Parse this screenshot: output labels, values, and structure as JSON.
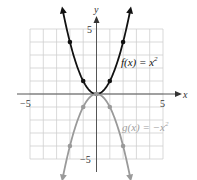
{
  "chart_data": {
    "type": "line",
    "title": "",
    "xlabel": "x",
    "ylabel": "y",
    "xlim": [
      -5,
      5
    ],
    "ylim": [
      -5,
      5
    ],
    "grid": true,
    "x_ticks_labeled": [
      "-5",
      "5"
    ],
    "y_ticks_labeled": [
      "5",
      "-5"
    ],
    "series": [
      {
        "name": "f(x) = x²",
        "label_text": "f(x) = x",
        "label_exp": "2",
        "color": "#111111",
        "points": [
          [
            -2,
            4
          ],
          [
            -1,
            1
          ],
          [
            0,
            0
          ],
          [
            1,
            1
          ],
          [
            2,
            4
          ]
        ],
        "arrows": "both-ends-up"
      },
      {
        "name": "g(x) = −x²",
        "label_text": "g(x) = −x",
        "label_exp": "2",
        "color": "#9a9a9a",
        "points": [
          [
            -2,
            -4
          ],
          [
            -1,
            -1
          ],
          [
            0,
            0
          ],
          [
            1,
            -1
          ],
          [
            2,
            -4
          ]
        ],
        "arrows": "both-ends-down"
      }
    ]
  },
  "labels": {
    "x_axis": "x",
    "y_axis": "y",
    "x_min": "−5",
    "x_max": "5",
    "y_max": "5",
    "y_min": "−5",
    "f_label": "f(x) = x",
    "f_exp": "2",
    "g_label": "g(x) = −x",
    "g_exp": "2"
  },
  "colors": {
    "grid": "#cfcfcf",
    "axis": "#555555",
    "f_curve": "#111111",
    "g_curve": "#9a9a9a"
  }
}
